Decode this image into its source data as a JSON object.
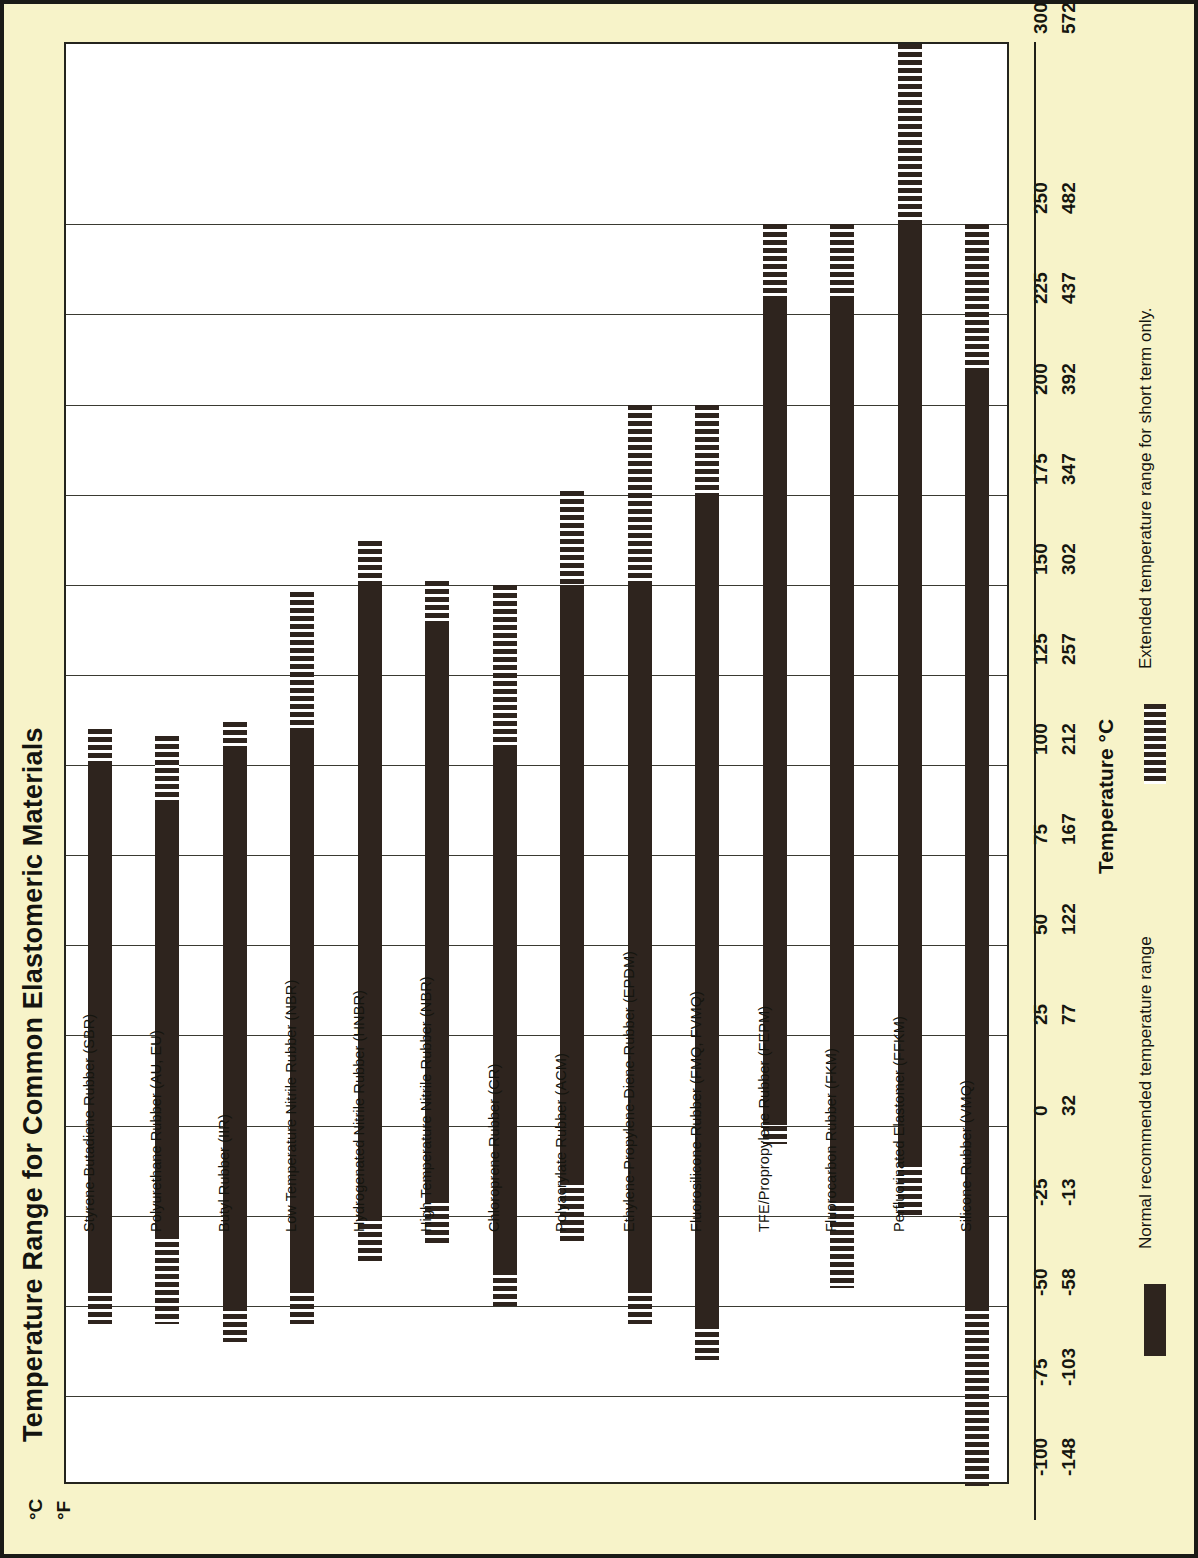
{
  "chart_title": "Temperature Range for Common Elastomeric Materials",
  "axis": {
    "title": "Temperature °C",
    "unit_c": "°C",
    "unit_f": "°F",
    "celsius_ticks": [
      300,
      250,
      225,
      200,
      175,
      150,
      125,
      100,
      75,
      50,
      25,
      0,
      -25,
      -50,
      -75,
      -100
    ],
    "fahrenheit_ticks": [
      572,
      482,
      437,
      392,
      347,
      302,
      257,
      212,
      167,
      122,
      77,
      32,
      -13,
      -58,
      -103,
      -148
    ]
  },
  "legend": {
    "normal_label": "Normal recommended temperature range",
    "extended_label": "Extended temperature range for short term only.",
    "normal_icon": "solid-bar-icon",
    "extended_icon": "hatched-bar-icon"
  },
  "colors": {
    "page_background": "#f7f3c9",
    "plot_background": "#ffffff",
    "bar": "#2e241e",
    "grid": "#3a3a32",
    "border": "#1a1a16"
  },
  "chart_data": {
    "type": "bar",
    "orientation": "vertical-ranges",
    "title": "Temperature Range for Common Elastomeric Materials",
    "xlabel": "",
    "ylabel": "Temperature °C",
    "ylim": [
      -100,
      300
    ],
    "grid": true,
    "legend_position": "bottom",
    "units": {
      "primary": "°C",
      "secondary": "°F"
    },
    "yticks_c": [
      300,
      250,
      225,
      200,
      175,
      150,
      125,
      100,
      75,
      50,
      25,
      0,
      -25,
      -50,
      -75,
      -100
    ],
    "yticks_f": [
      572,
      482,
      437,
      392,
      347,
      302,
      257,
      212,
      167,
      122,
      77,
      32,
      -13,
      -58,
      -103,
      -148
    ],
    "series": [
      {
        "name": "Normal recommended temperature range",
        "style": "solid"
      },
      {
        "name": "Extended temperature range for short term only.",
        "style": "hatched"
      }
    ],
    "categories": [
      "Styrene-Butadiene Rubber (SBR)",
      "Polyurethane Rubber (AU, EU)",
      "Butyl Rubber (IIR)",
      "Low Temperature Nitrile Rubber (NBR)",
      "Hydrogenated Nitrile Rubber (HNBR)",
      "High Temperature Nitrile Rubber (NBR)",
      "Chloroprene Rubber (CR)",
      "Polyacrylate Rubber (ACM)",
      "Ethylene-Propylene-Diene-Rubber (EPDM)",
      "Fluorosilicone-Rubber (FMQ, FVMQ)",
      "TFE/Propropylene Rubber (FEPM)",
      "Fluorocarbon Rubber (FKM)",
      "Perfluorinated Elastomer (FFKM)",
      "Silicone-Rubber (VMQ)"
    ],
    "bars": [
      {
        "label": "Styrene-Butadiene Rubber (SBR)",
        "normal_min": -45,
        "normal_max": 100,
        "ext_min": -55,
        "ext_max": 110
      },
      {
        "label": "Polyurethane Rubber (AU, EU)",
        "normal_min": -30,
        "normal_max": 90,
        "ext_min": -55,
        "ext_max": 108
      },
      {
        "label": "Butyl Rubber (IIR)",
        "normal_min": -50,
        "normal_max": 105,
        "ext_min": -60,
        "ext_max": 112
      },
      {
        "label": "Low Temperature Nitrile Rubber (NBR)",
        "normal_min": -45,
        "normal_max": 110,
        "ext_min": -55,
        "ext_max": 148
      },
      {
        "label": "Hydrogenated Nitrile Rubber (HNBR)",
        "normal_min": -25,
        "normal_max": 150,
        "ext_min": -38,
        "ext_max": 162
      },
      {
        "label": "High Temperature Nitrile Rubber (NBR)",
        "normal_min": -20,
        "normal_max": 140,
        "ext_min": -33,
        "ext_max": 151
      },
      {
        "label": "Chloroprene Rubber (CR)",
        "normal_min": -40,
        "normal_max": 105,
        "ext_min": -50,
        "ext_max": 150
      },
      {
        "label": "Polyacrylate Rubber (ACM)",
        "normal_min": -15,
        "normal_max": 150,
        "ext_min": -33,
        "ext_max": 176
      },
      {
        "label": "Ethylene-Propylene-Diene-Rubber (EPDM)",
        "normal_min": -45,
        "normal_max": 150,
        "ext_min": -55,
        "ext_max": 200
      },
      {
        "label": "Fluorosilicone-Rubber (FMQ, FVMQ)",
        "normal_min": -55,
        "normal_max": 175,
        "ext_min": -65,
        "ext_max": 200
      },
      {
        "label": "TFE/Propropylene Rubber (FEPM)",
        "normal_min": 0,
        "normal_max": 230,
        "ext_min": -5,
        "ext_max": 250
      },
      {
        "label": "Fluorocarbon Rubber (FKM)",
        "normal_min": -20,
        "normal_max": 230,
        "ext_min": -45,
        "ext_max": 250
      },
      {
        "label": "Perfluorinated Elastomer (FFKM)",
        "normal_min": -10,
        "normal_max": 250,
        "ext_min": -25,
        "ext_max": 300
      },
      {
        "label": "Silicone-Rubber (VMQ)",
        "normal_min": -50,
        "normal_max": 210,
        "ext_min": -100,
        "ext_max": 250
      }
    ]
  }
}
